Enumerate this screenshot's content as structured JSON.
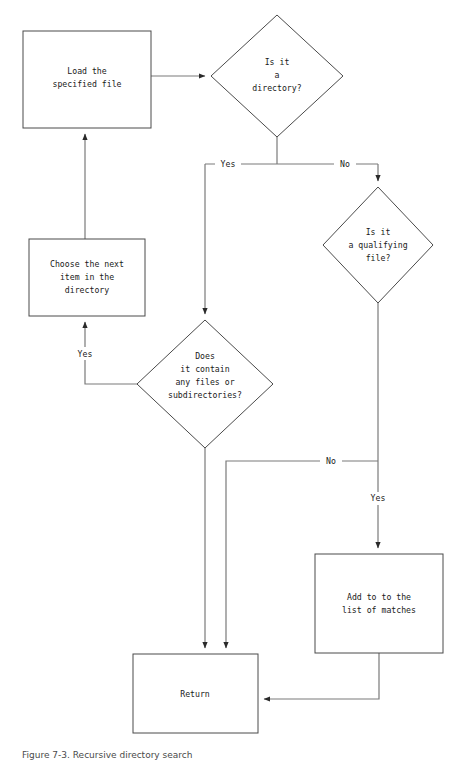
{
  "figure": {
    "caption": "Figure 7-3. Recursive directory search",
    "colors": {
      "background": "#ffffff",
      "node_stroke": "#4a4a4a",
      "node_fill": "#ffffff",
      "connector_stroke": "#7a7a7a",
      "text": "#1a1a1a"
    }
  },
  "nodes": [
    {
      "id": "load-file",
      "type": "process",
      "lines": [
        "Load the",
        "specified file"
      ]
    },
    {
      "id": "is-directory",
      "type": "decision",
      "lines": [
        "Is it",
        "a",
        "directory?"
      ]
    },
    {
      "id": "is-qualifying-file",
      "type": "decision",
      "lines": [
        "Is it",
        "a qualifying",
        "file?"
      ]
    },
    {
      "id": "choose-next-item",
      "type": "process",
      "lines": [
        "Choose the next",
        "item in the",
        "directory"
      ]
    },
    {
      "id": "does-it-contain",
      "type": "decision",
      "lines": [
        "Does",
        "it contain",
        "any files or",
        "subdirectories?"
      ]
    },
    {
      "id": "add-to-matches",
      "type": "process",
      "lines": [
        "Add to to the",
        "list of matches"
      ]
    },
    {
      "id": "return",
      "type": "process",
      "lines": [
        "Return"
      ]
    }
  ],
  "edge_labels": {
    "directory_yes": "Yes",
    "directory_no": "No",
    "contain_yes": "Yes",
    "contain_no": "No",
    "qualifying_yes": "Yes"
  }
}
